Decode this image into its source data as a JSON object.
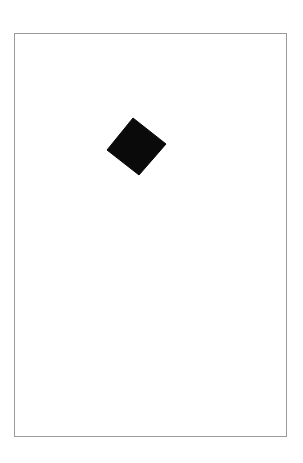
{
  "figure": {
    "title": "Black rotated square inside a rectangular frame",
    "background_color": "#ffffff",
    "canvas": {
      "width": 303,
      "height": 463
    },
    "frame": {
      "label": "Frame border",
      "shape": "rectangle",
      "x": 14,
      "y": 33,
      "width": 273,
      "height": 404,
      "stroke_color": "#9a9a9a",
      "stroke_width": 1,
      "fill_color": "#ffffff"
    },
    "shape": {
      "label": "Black diamond",
      "kind": "square",
      "orientation": "rotated",
      "rotation_degrees": 39,
      "side_length": 41,
      "fill_color": "#0a0a0a",
      "center": {
        "x": 136,
        "y": 146
      },
      "vertices": [
        {
          "name": "top",
          "x": 133,
          "y": 118
        },
        {
          "name": "right",
          "x": 166,
          "y": 144
        },
        {
          "name": "bottom",
          "x": 139,
          "y": 175
        },
        {
          "name": "left",
          "x": 107,
          "y": 150
        }
      ],
      "bounding_box": {
        "x": 107,
        "y": 118,
        "width": 59,
        "height": 57
      }
    }
  }
}
